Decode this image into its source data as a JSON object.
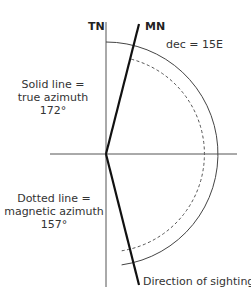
{
  "diagram": {
    "labels": {
      "true_north": "TN",
      "magnetic_north": "MN",
      "declination": "dec = 15E",
      "solid_line_l1": "Solid line =",
      "solid_line_l2": "true azimuth",
      "solid_line_l3": "172°",
      "dotted_line_l1": "Dotted line =",
      "dotted_line_l2": "magnetic azimuth",
      "dotted_line_l3": "157°",
      "direction": "Direction of sighting"
    },
    "values": {
      "true_azimuth_deg": 172,
      "magnetic_azimuth_deg": 157,
      "declination_deg": 15,
      "declination_dir": "E"
    },
    "colors": {
      "line": "#222222",
      "thin_line": "#555555",
      "text": "#333333"
    }
  }
}
